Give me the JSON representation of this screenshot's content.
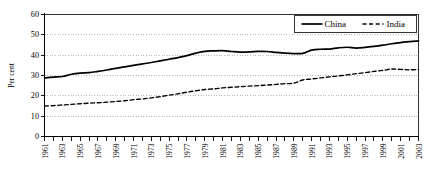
{
  "chart_data": {
    "type": "line",
    "title": "",
    "subtitle": "",
    "xlabel": "",
    "ylabel": "Per cent",
    "ylim": [
      0,
      60
    ],
    "xlim": [
      1961,
      2003
    ],
    "yticks": [
      0,
      10,
      20,
      30,
      40,
      50,
      60
    ],
    "ytick_labels": [
      "0",
      "10",
      "20",
      "30",
      "40",
      "50",
      "60"
    ],
    "grid": true,
    "grid_axis": "y",
    "legend_position": "top-right",
    "legend": [
      "China",
      "India"
    ],
    "x": [
      1961,
      1962,
      1963,
      1964,
      1965,
      1966,
      1967,
      1968,
      1969,
      1970,
      1971,
      1972,
      1973,
      1974,
      1975,
      1976,
      1977,
      1978,
      1979,
      1980,
      1981,
      1982,
      1983,
      1984,
      1985,
      1986,
      1987,
      1988,
      1989,
      1990,
      1991,
      1992,
      1993,
      1994,
      1995,
      1996,
      1997,
      1998,
      1999,
      2000,
      2001,
      2002,
      2003
    ],
    "xtick_labels": [
      "1961",
      "1962",
      "1963",
      "1964",
      "1965",
      "1966",
      "1967",
      "1968",
      "1969",
      "1970",
      "1971",
      "1972",
      "1973",
      "1974",
      "1975",
      "1976",
      "1977",
      "1978",
      "1979",
      "1980",
      "1981",
      "1982",
      "1983",
      "1984",
      "1985",
      "1986",
      "1987",
      "1988",
      "1989",
      "1990",
      "1991",
      "1992",
      "1993",
      "1994",
      "1995",
      "1996",
      "1997",
      "1998",
      "1999",
      "2000",
      "2001",
      "2002",
      "2003"
    ],
    "xtick_label_visible": [
      true,
      false,
      true,
      false,
      true,
      false,
      true,
      false,
      true,
      false,
      true,
      false,
      true,
      false,
      true,
      false,
      true,
      false,
      true,
      false,
      true,
      false,
      true,
      false,
      true,
      false,
      true,
      false,
      true,
      false,
      true,
      false,
      true,
      false,
      true,
      false,
      true,
      false,
      true,
      false,
      true,
      false,
      true
    ],
    "series": [
      {
        "name": "China",
        "style": "solid",
        "color": "#000000",
        "values": [
          28.8,
          29.2,
          29.5,
          30.6,
          31.2,
          31.4,
          32.0,
          32.7,
          33.5,
          34.2,
          35.0,
          35.7,
          36.4,
          37.2,
          38.0,
          38.8,
          39.8,
          41.0,
          41.9,
          42.1,
          42.2,
          41.8,
          41.5,
          41.6,
          41.9,
          41.8,
          41.4,
          41.0,
          40.8,
          40.9,
          42.5,
          42.9,
          43.0,
          43.6,
          43.9,
          43.5,
          43.8,
          44.3,
          44.9,
          45.6,
          46.2,
          46.7,
          47.0
        ]
      },
      {
        "name": "India",
        "style": "dashed",
        "color": "#000000",
        "values": [
          15.0,
          15.2,
          15.5,
          15.8,
          16.1,
          16.4,
          16.6,
          16.9,
          17.2,
          17.6,
          18.1,
          18.5,
          19.0,
          19.6,
          20.3,
          21.0,
          21.8,
          22.5,
          23.1,
          23.4,
          23.9,
          24.2,
          24.5,
          24.8,
          25.0,
          25.3,
          25.6,
          26.0,
          26.2,
          27.8,
          28.3,
          28.8,
          29.3,
          29.8,
          30.3,
          30.9,
          31.4,
          32.0,
          32.5,
          33.2,
          33.0,
          32.8,
          33.0
        ]
      }
    ]
  }
}
